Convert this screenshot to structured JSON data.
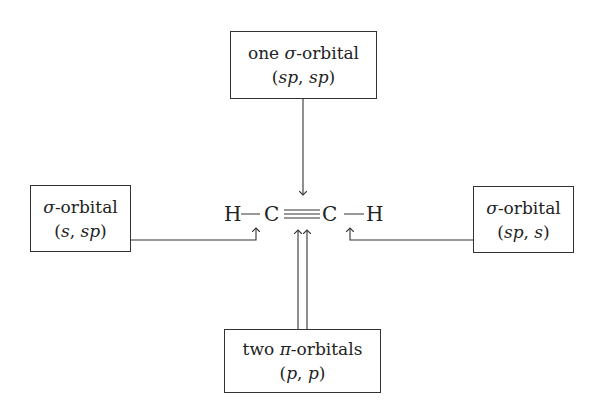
{
  "diagram": {
    "molecule": {
      "atoms": [
        "H",
        "C",
        "C",
        "H"
      ],
      "bonds": [
        "single",
        "triple",
        "single"
      ],
      "label": "H—C≡C—H"
    },
    "boxes": {
      "top": {
        "title_prefix": "one ",
        "symbol": "σ",
        "title_suffix": "-orbital",
        "subtitle": "(sp, sp)",
        "subtitle_parts": [
          "(",
          "sp",
          ", ",
          "sp",
          ")"
        ]
      },
      "left": {
        "title_prefix": "",
        "symbol": "σ",
        "title_suffix": "-orbital",
        "subtitle": "(s, sp)",
        "subtitle_parts": [
          "(",
          "s",
          ", ",
          "sp",
          ")"
        ]
      },
      "right": {
        "title_prefix": "",
        "symbol": "σ",
        "title_suffix": "-orbital",
        "subtitle": "(sp, s)",
        "subtitle_parts": [
          "(",
          "sp",
          ", ",
          "s",
          ")"
        ]
      },
      "bottom": {
        "title_prefix": "two ",
        "symbol": "π",
        "title_suffix": "-orbitals",
        "subtitle": "(p, p)",
        "subtitle_parts": [
          "(",
          "p",
          ", ",
          "p",
          ")"
        ]
      }
    },
    "connections": [
      {
        "from": "top",
        "to": "C≡C triple bond",
        "arrows": 1
      },
      {
        "from": "left",
        "to": "H—C bond (left)",
        "arrows": 1
      },
      {
        "from": "right",
        "to": "C—H bond (right)",
        "arrows": 1
      },
      {
        "from": "bottom",
        "to": "C≡C triple bond",
        "arrows": 2
      }
    ]
  }
}
